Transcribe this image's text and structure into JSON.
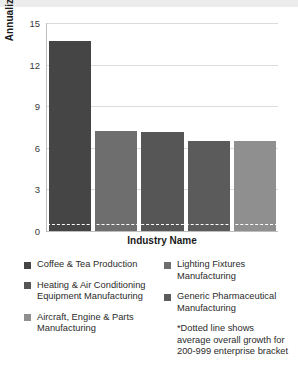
{
  "chart_data": {
    "type": "bar",
    "title": "",
    "xlabel": "Industry Name",
    "ylabel": "Annualized % change",
    "categories": [
      "Coffee & Tea Production",
      "Lighting Fixtures Manufacturing",
      "Heating & Air Conditioning Equipment Manufacturing",
      "Generic Pharmaceutical Manufacturing",
      "Aircraft, Engine & Parts Manufacturing"
    ],
    "values": [
      13.7,
      7.2,
      7.15,
      6.5,
      6.5
    ],
    "colors": [
      "#454545",
      "#6e6e6e",
      "#565656",
      "#5b5b5b",
      "#8f8f8f"
    ],
    "ylim": [
      0,
      15
    ],
    "yticks": [
      "0",
      "3",
      "6",
      "9",
      "12",
      "15"
    ],
    "ytick_values": [
      0,
      3,
      6,
      9,
      12,
      15
    ],
    "grid": true,
    "legend_position": "bottom",
    "reference_line": {
      "value": 0.5,
      "style": "dotted",
      "color": "#ffffff",
      "note": "*Dotted line shows average overall growth for 200-999 enterprise bracket"
    }
  },
  "legend": {
    "left_items": [
      {
        "label": "Coffee & Tea Production",
        "color": "#454545"
      },
      {
        "label": "Heating & Air Conditioning Equipment Manufacturing",
        "color": "#565656"
      },
      {
        "label": "Aircraft, Engine & Parts Manufacturing",
        "color": "#8f8f8f"
      }
    ],
    "right_items": [
      {
        "label": "Lighting Fixtures Manufacturing",
        "color": "#6e6e6e"
      },
      {
        "label": "Generic Pharmaceutical Manufacturing",
        "color": "#5b5b5b"
      }
    ],
    "footnote": "*Dotted line shows average overall growth for 200-999 enterprise bracket"
  }
}
